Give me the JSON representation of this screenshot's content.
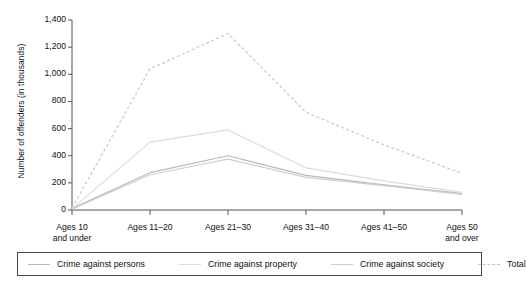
{
  "chart_data": {
    "type": "line",
    "title": "",
    "xlabel": "",
    "ylabel": "Number of offenders (in thousands)",
    "ylim": [
      0,
      1400
    ],
    "yticks": [
      0,
      200,
      400,
      600,
      800,
      1000,
      1200,
      1400
    ],
    "ytick_labels": [
      "0",
      "200",
      "400",
      "600",
      "800",
      "1,000",
      "1,200",
      "1,400"
    ],
    "grid": false,
    "legend_position": "bottom",
    "categories": [
      "Ages 10 and under",
      "Ages 11–20",
      "Ages 21–30",
      "Ages 31–40",
      "Ages 41–50",
      "Ages 50 and over"
    ],
    "category_lines": [
      [
        "Ages 10",
        "and under"
      ],
      [
        "Ages 11–20",
        ""
      ],
      [
        "Ages 21–30",
        ""
      ],
      [
        "Ages 31–40",
        ""
      ],
      [
        "Ages 41–50",
        ""
      ],
      [
        "Ages 50",
        "and over"
      ]
    ],
    "series": [
      {
        "name": "Crime against persons",
        "values": [
          10,
          275,
          400,
          255,
          185,
          120
        ],
        "style": "solid",
        "color": "#b9b9b9"
      },
      {
        "name": "Crime against property",
        "values": [
          8,
          500,
          590,
          310,
          215,
          130
        ],
        "style": "solid",
        "color": "#dcdcdc"
      },
      {
        "name": "Crime against society",
        "values": [
          5,
          260,
          375,
          240,
          180,
          115
        ],
        "style": "solid",
        "color": "#cfcfcf"
      },
      {
        "name": "Total",
        "values": [
          15,
          1040,
          1300,
          720,
          480,
          270
        ],
        "style": "dashed",
        "color": "#c8c8c8"
      }
    ]
  },
  "legend": {
    "items": [
      {
        "label": "Crime against persons",
        "style": "solid",
        "color": "#b9b9b9"
      },
      {
        "label": "Crime against property",
        "style": "solid",
        "color": "#dcdcdc"
      },
      {
        "label": "Crime against society",
        "style": "solid",
        "color": "#cfcfcf"
      },
      {
        "label": "Total",
        "style": "dashed",
        "color": "#c8c8c8"
      }
    ]
  },
  "axes": {
    "axis_color": "#555555",
    "text_color": "#111111"
  }
}
